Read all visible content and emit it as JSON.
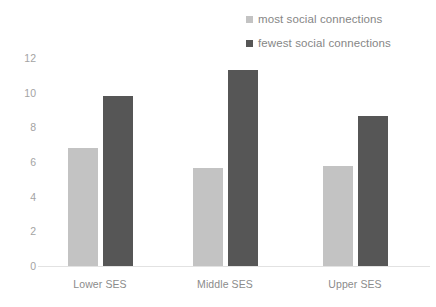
{
  "chart_data": {
    "type": "bar",
    "title": "",
    "subtitle": "",
    "xlabel": "",
    "ylabel": "",
    "categories": [
      "Lower SES",
      "Middle SES",
      "Upper SES"
    ],
    "series": [
      {
        "name": "most social connections",
        "color": "#c3c3c3",
        "values": [
          6.8,
          5.65,
          5.75
        ]
      },
      {
        "name": "fewest social connections",
        "color": "#565656",
        "values": [
          9.8,
          11.3,
          8.65
        ]
      }
    ],
    "ylim": [
      0,
      12
    ],
    "y_ticks": [
      0,
      2,
      4,
      6,
      8,
      10,
      12
    ],
    "y_tick_labels": [
      "0",
      "2",
      "4",
      "6",
      "8",
      "10",
      "12"
    ],
    "grid": false,
    "legend_position": "top-right",
    "axis_line_color": "#e2e2e2",
    "tick_label_color": "#a3a3a3",
    "category_label_color": "#8b8b8b",
    "background_color": "#ffffff"
  },
  "legend": {
    "items": [
      {
        "label": "most social connections",
        "color": "#c3c3c3",
        "swatch_name": "legend-swatch-light"
      },
      {
        "label": "fewest social connections",
        "color": "#565656",
        "swatch_name": "legend-swatch-dark"
      }
    ]
  },
  "axis": {
    "y_tick_labels": [
      "12",
      "10",
      "8",
      "6",
      "4",
      "2",
      "0"
    ],
    "x_tick_labels": [
      "Lower SES",
      "Middle SES",
      "Upper SES"
    ]
  },
  "layout": {
    "plot_left": 38,
    "plot_baseline_y": 266,
    "plot_top_y": 58,
    "px_per_unit": 17.333,
    "bar_width": 30,
    "group_centers_x": [
      100,
      225,
      355
    ],
    "intra_group_gap": 5
  }
}
